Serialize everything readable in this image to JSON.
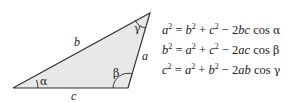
{
  "triangle": {
    "fill_color": "#e8e8e8",
    "stroke_color": "#333333",
    "sides": {
      "a": "a",
      "b": "b",
      "c": "c"
    },
    "angles": {
      "alpha": "α",
      "beta": "β",
      "gamma": "γ"
    }
  },
  "equations": [
    {
      "lhs": "a",
      "t1": "b",
      "t2": "c",
      "coef": "2",
      "prod": "bc",
      "fn": "cos",
      "angle": "α"
    },
    {
      "lhs": "b",
      "t1": "a",
      "t2": "c",
      "coef": "2",
      "prod": "ac",
      "fn": "cos",
      "angle": "β"
    },
    {
      "lhs": "c",
      "t1": "a",
      "t2": "b",
      "coef": "2",
      "prod": "ab",
      "fn": "cos",
      "angle": "γ"
    }
  ],
  "symbols": {
    "exp": "2",
    "eq": "=",
    "plus": "+",
    "minus": "−"
  }
}
